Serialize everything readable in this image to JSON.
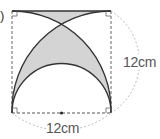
{
  "diagram": {
    "type": "geometry-figure",
    "labels": {
      "side_right": "12cm",
      "side_bottom": "12cm",
      "problem_marker": ")"
    },
    "colors": {
      "shade": "#d4d4d4",
      "stroke": "#333333",
      "dashed": "#666666",
      "dim_arc": "#aaaaaa"
    },
    "square": {
      "x": 12,
      "y": 11,
      "size": 99
    }
  }
}
